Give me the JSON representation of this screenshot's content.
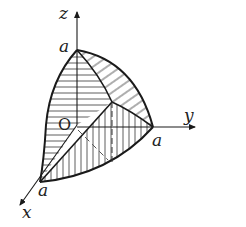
{
  "figure": {
    "type": "3d-solid-intersection-diagram",
    "axes": {
      "z": {
        "label": "z"
      },
      "y": {
        "label": "y"
      },
      "x": {
        "label": "x"
      },
      "origin": {
        "label": "O"
      }
    },
    "points": {
      "z_intercept": {
        "label": "a"
      },
      "y_intercept": {
        "label": "a"
      },
      "x_intercept": {
        "label": "a"
      }
    },
    "colors": {
      "stroke": "#1a1a1a",
      "background": "#ffffff"
    }
  }
}
